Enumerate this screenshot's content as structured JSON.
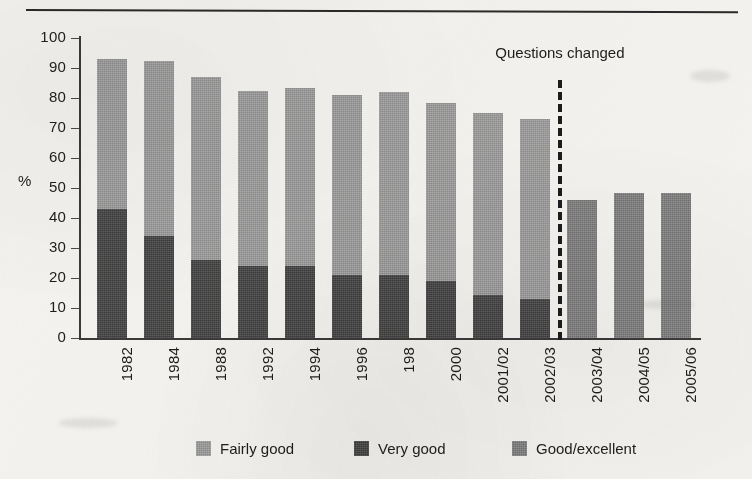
{
  "figure": {
    "axis_label_y": "%",
    "annotation": "Questions changed"
  },
  "legend": {
    "items": [
      {
        "label": "Fairly good",
        "color": "#8c8c8c",
        "left": 196
      },
      {
        "label": "Very good",
        "color": "#3b3b3b",
        "left": 354
      },
      {
        "label": "Good/excellent",
        "color": "#6f6f6f",
        "left": 512
      }
    ]
  },
  "chart_data": {
    "type": "bar",
    "title": "",
    "subtitle": "",
    "xlabel": "",
    "ylabel": "%",
    "ylim": [
      0,
      100
    ],
    "ytick_step": 10,
    "yticks": [
      "0",
      "10",
      "20",
      "30",
      "40",
      "50",
      "60",
      "70",
      "80",
      "90",
      "100"
    ],
    "grid": false,
    "stacked": true,
    "legend_position": "bottom",
    "categories": [
      "1982",
      "1984",
      "1988",
      "1992",
      "1994",
      "1996",
      "198",
      "2000",
      "2001/02",
      "2002/03",
      "2003/04",
      "2004/05",
      "2005/06"
    ],
    "series": [
      {
        "name": "Very good",
        "color": "#3b3b3b",
        "values": [
          43,
          34,
          26,
          24,
          24,
          21,
          21,
          19,
          14.5,
          13,
          null,
          null,
          null
        ]
      },
      {
        "name": "Fairly good",
        "color": "#8c8c8c",
        "values": [
          50,
          58.5,
          61,
          58.5,
          59.5,
          60,
          61,
          59.5,
          60.5,
          60,
          null,
          null,
          null
        ]
      },
      {
        "name": "Good/excellent",
        "color": "#6f6f6f",
        "values": [
          null,
          null,
          null,
          null,
          null,
          null,
          null,
          null,
          null,
          null,
          46,
          48.5,
          48.5
        ]
      }
    ],
    "totals": [
      93,
      92.5,
      87,
      82.5,
      83.5,
      81,
      82,
      78.5,
      75,
      73,
      46,
      48.5,
      48.5
    ],
    "annotations": [
      {
        "text": "Questions changed",
        "after_category": "2002/03",
        "style": "dashed-vertical-line"
      }
    ]
  }
}
